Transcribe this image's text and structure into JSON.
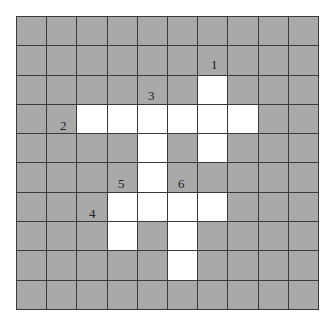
{
  "puzzle": {
    "type": "crossword-grid",
    "rows": 10,
    "cols": 10,
    "colors": {
      "block": "#a9a9a9",
      "open": "#ffffff",
      "line": "#3a3a3a"
    },
    "white_cells": [
      [
        2,
        6
      ],
      [
        3,
        2
      ],
      [
        3,
        3
      ],
      [
        3,
        4
      ],
      [
        3,
        5
      ],
      [
        3,
        6
      ],
      [
        3,
        7
      ],
      [
        4,
        4
      ],
      [
        4,
        6
      ],
      [
        5,
        4
      ],
      [
        6,
        3
      ],
      [
        6,
        4
      ],
      [
        6,
        5
      ],
      [
        6,
        6
      ],
      [
        7,
        3
      ],
      [
        7,
        5
      ],
      [
        8,
        5
      ]
    ],
    "clues": [
      {
        "label": "1",
        "x": 211,
        "y": 58
      },
      {
        "label": "2",
        "x": 60,
        "y": 119
      },
      {
        "label": "3",
        "x": 148,
        "y": 89
      },
      {
        "label": "4",
        "x": 89,
        "y": 207
      },
      {
        "label": "5",
        "x": 118,
        "y": 177
      },
      {
        "label": "6",
        "x": 178,
        "y": 177
      }
    ]
  }
}
